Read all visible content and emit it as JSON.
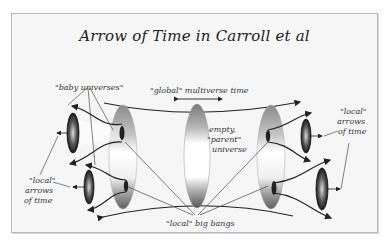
{
  "title": "Arrow of Time in Carroll et al",
  "labels": {
    "baby_universes": "\"baby universes\"",
    "global_time": "\"global\" multiverse time",
    "empty_parent_1": "empty,",
    "empty_parent_2": "\"parent\"",
    "empty_parent_3": "universe",
    "local_arrows_left_1": "\"local\"",
    "local_arrows_left_2": "arrows",
    "local_arrows_left_3": "of time",
    "local_arrows_right_1": "\"local\"",
    "local_arrows_right_2": "arrows",
    "local_arrows_right_3": "of time",
    "local_big_bangs": "\"local\" big bangs"
  },
  "colors": {
    "background": "#f6f6f6",
    "frame_border": "#b8b8b8",
    "ink": "#222222",
    "ellipse_dark": "#555555",
    "ellipse_mid": "#9a9a9a",
    "cone_dark": "#2a2a2a"
  }
}
